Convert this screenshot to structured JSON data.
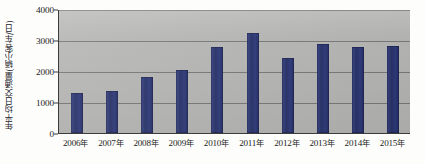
{
  "chart_data": {
    "type": "bar",
    "title": "",
    "subtitle": "",
    "xlabel": "",
    "ylabel": "年平均日交通量(辆小客车/日)",
    "categories": [
      "2006年",
      "2007年",
      "2008年",
      "2009年",
      "2010年",
      "2011年",
      "2012年",
      "2013年",
      "2014年",
      "2015年"
    ],
    "values": [
      1300,
      1350,
      1800,
      2030,
      2780,
      3220,
      2420,
      2880,
      2790,
      2800
    ],
    "series": [
      {
        "name": "年平均日交通量",
        "values": [
          1300,
          1350,
          1800,
          2030,
          2780,
          3220,
          2420,
          2880,
          2790,
          2800
        ]
      }
    ],
    "ylim": [
      0,
      4000
    ],
    "yticks": [
      0,
      1000,
      2000,
      3000,
      4000
    ],
    "ytick_labels": [
      "0",
      "1000",
      "2000",
      "3000",
      "4000"
    ],
    "grid": true,
    "legend": false,
    "legend_position": "none",
    "bar_color": "#2d3a7a",
    "plot_background": "#b7b7b5",
    "gridline_color": "#6e6e6e",
    "axis_color": "#3c3c3c"
  }
}
